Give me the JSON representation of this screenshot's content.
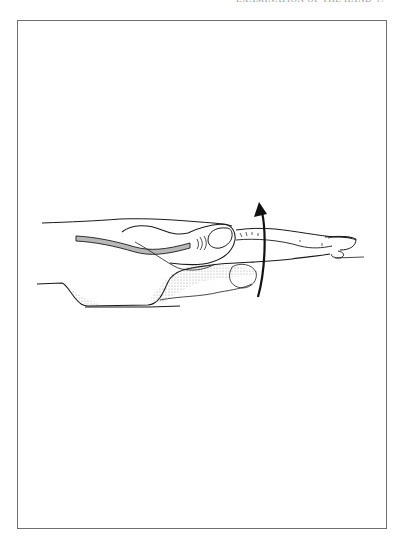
{
  "page": {
    "running_head": "EXAMINATION OF THE HAND",
    "page_number": "17"
  },
  "figure": {
    "motion_arrow": "curved-arrow-up",
    "colors": {
      "line": "#1a1a1a",
      "tendon_fill": "#b8b8b8",
      "shading": "#cfcfcf",
      "frame": "#6e6e6e"
    }
  }
}
